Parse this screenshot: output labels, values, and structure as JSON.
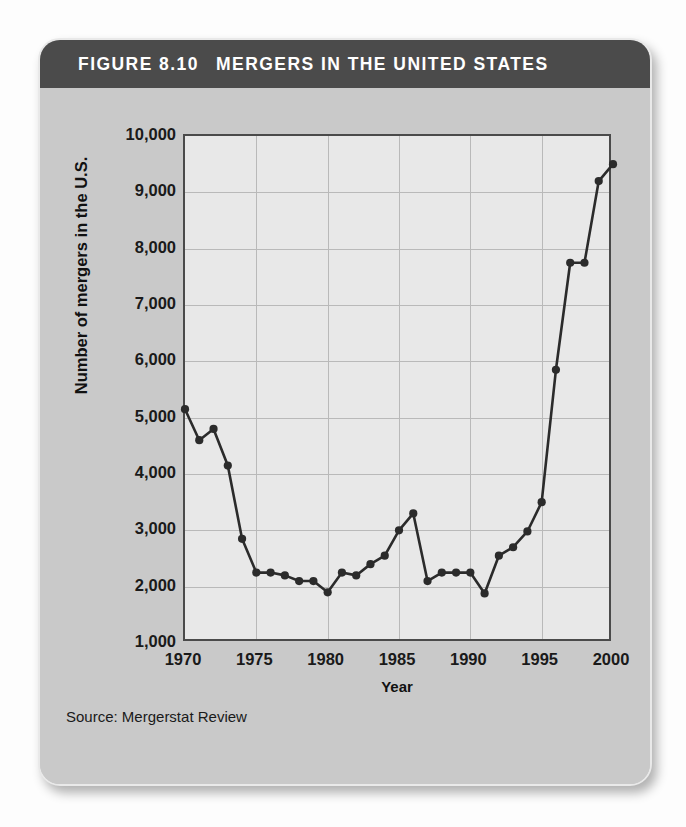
{
  "figure": {
    "number_label": "FIGURE 8.10",
    "title": "MERGERS IN THE UNITED STATES",
    "header_bg": "#4b4b4b",
    "card_bg": "#c9c9c9",
    "plot_bg": "#e8e8e8",
    "line_color": "#2b2b2b",
    "source": "Source: Mergerstat Review"
  },
  "chart_data": {
    "type": "line",
    "title": "MERGERS IN THE UNITED STATES",
    "subtitle": "FIGURE 8.10",
    "xlabel": "Year",
    "ylabel": "Number of mergers in the U.S.",
    "xlim": [
      1970,
      2000
    ],
    "ylim": [
      0,
      10000
    ],
    "xticks": [
      1970,
      1975,
      1980,
      1985,
      1990,
      1995,
      2000
    ],
    "xtick_labels": [
      "1970",
      "1975",
      "1980",
      "1985",
      "1990",
      "1995",
      "2000"
    ],
    "yticks": [
      1000,
      2000,
      3000,
      4000,
      5000,
      6000,
      7000,
      8000,
      9000,
      10000
    ],
    "ytick_labels": [
      "1,000",
      "2,000",
      "3,000",
      "4,000",
      "5,000",
      "6,000",
      "7,000",
      "8,000",
      "9,000",
      "10,000"
    ],
    "grid": true,
    "legend": "none",
    "markers": "filled-circle",
    "source": "Source: Mergerstat Review",
    "x": [
      1970,
      1971,
      1972,
      1973,
      1974,
      1975,
      1976,
      1977,
      1978,
      1979,
      1980,
      1981,
      1982,
      1983,
      1984,
      1985,
      1986,
      1987,
      1988,
      1989,
      1990,
      1991,
      1992,
      1993,
      1994,
      1995,
      1996,
      1997,
      1998,
      1999,
      2000
    ],
    "values": [
      5150,
      4600,
      4800,
      4150,
      2850,
      2250,
      2250,
      2200,
      2100,
      2100,
      1900,
      2250,
      2200,
      2400,
      2550,
      3000,
      3300,
      2100,
      2250,
      2250,
      2250,
      1880,
      2550,
      2700,
      2980,
      3500,
      5850,
      7750,
      7750,
      9200,
      9500
    ],
    "series": [
      {
        "name": "Number of mergers in the U.S.",
        "values": [
          5150,
          4600,
          4800,
          4150,
          2850,
          2250,
          2250,
          2200,
          2100,
          2100,
          1900,
          2250,
          2200,
          2400,
          2550,
          3000,
          3300,
          2100,
          2250,
          2250,
          2250,
          1880,
          2550,
          2700,
          2980,
          3500,
          5850,
          7750,
          7750,
          9200,
          9500
        ]
      }
    ]
  }
}
